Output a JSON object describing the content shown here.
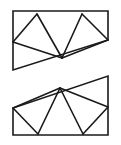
{
  "figure": {
    "title": "",
    "caption": "",
    "background_color": "#ffffff",
    "stroke_color": "#1a1a1a",
    "fill_color": "#ffffff",
    "stroke_width": 1.6,
    "canvas": {
      "width": 121,
      "height": 145
    },
    "labels": [],
    "shapes": [
      {
        "name": "upper-quadrilateral",
        "outline": [
          [
            13,
            11
          ],
          [
            108,
            11
          ],
          [
            108,
            40
          ],
          [
            13,
            70
          ]
        ],
        "fan_vertex": [
          62,
          58
        ],
        "fan_targets": [
          [
            13,
            11
          ],
          [
            37,
            14
          ],
          [
            13,
            42
          ],
          [
            82,
            14
          ],
          [
            108,
            40
          ]
        ],
        "interior_edges": [
          [
            [
              13,
              42
            ],
            [
              37,
              14
            ]
          ],
          [
            [
              37,
              14
            ],
            [
              62,
              58
            ]
          ],
          [
            [
              13,
              42
            ],
            [
              62,
              58
            ]
          ],
          [
            [
              62,
              58
            ],
            [
              82,
              14
            ]
          ],
          [
            [
              82,
              14
            ],
            [
              108,
              40
            ]
          ],
          [
            [
              62,
              58
            ],
            [
              108,
              40
            ]
          ]
        ],
        "triangle_count": 4
      },
      {
        "name": "lower-quadrilateral",
        "outline": [
          [
            108,
            76
          ],
          [
            108,
            135
          ],
          [
            13,
            135
          ],
          [
            13,
            108
          ]
        ],
        "fan_vertex": [
          60,
          88
        ],
        "fan_targets": [
          [
            13,
            108
          ],
          [
            38,
            134
          ],
          [
            83,
            134
          ],
          [
            108,
            107
          ]
        ],
        "interior_edges": [
          [
            [
              13,
              108
            ],
            [
              60,
              88
            ]
          ],
          [
            [
              60,
              88
            ],
            [
              38,
              134
            ]
          ],
          [
            [
              13,
              108
            ],
            [
              38,
              134
            ]
          ],
          [
            [
              60,
              88
            ],
            [
              83,
              134
            ]
          ],
          [
            [
              83,
              134
            ],
            [
              108,
              107
            ]
          ],
          [
            [
              60,
              88
            ],
            [
              108,
              107
            ]
          ]
        ],
        "triangle_count": 4
      }
    ]
  }
}
